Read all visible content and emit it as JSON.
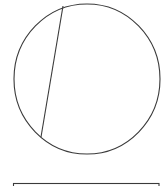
{
  "diagram": {
    "stroke_color": "#3a3a3a",
    "circle": {
      "cx": 87,
      "cy": 79,
      "rx": 73,
      "ry": 75
    },
    "chord": {
      "x1": 63,
      "y1": 6,
      "x2": 41,
      "y2": 137
    },
    "rectangle": {
      "x": 13.5,
      "y": 183.5,
      "width": 145.5,
      "height": 10
    }
  }
}
